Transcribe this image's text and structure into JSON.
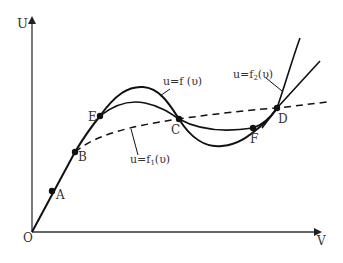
{
  "diagram": {
    "axes": {
      "y_label": "U",
      "x_label": "V",
      "origin_label": "O"
    },
    "points": [
      {
        "label": "A",
        "x": 52,
        "y": 191
      },
      {
        "label": "B",
        "x": 75,
        "y": 152
      },
      {
        "label": "E",
        "x": 100,
        "y": 116
      },
      {
        "label": "C",
        "x": 179,
        "y": 119
      },
      {
        "label": "F",
        "x": 253,
        "y": 128
      },
      {
        "label": "D",
        "x": 277,
        "y": 108
      }
    ],
    "curve_labels": {
      "f": "u=f (υ)",
      "f1_prefix": "u=f",
      "f1_sub": "1",
      "f1_suffix": "(υ)",
      "f2_prefix": "u=f",
      "f2_sub": "2",
      "f2_suffix": "(υ)"
    },
    "colors": {
      "line": "#111111",
      "axis": "#333333",
      "text": "#333333"
    }
  }
}
